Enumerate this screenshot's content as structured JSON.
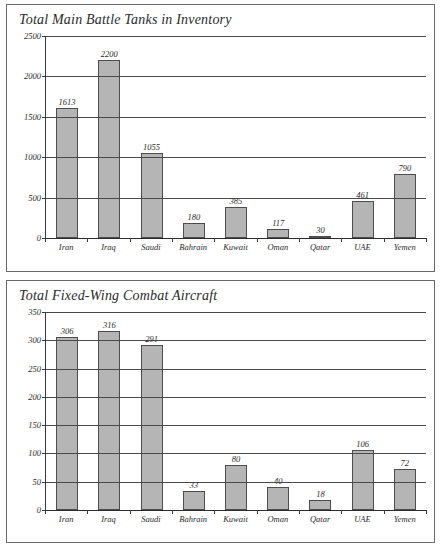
{
  "chart_data": [
    {
      "type": "bar",
      "title": "Total Main Battle Tanks in Inventory",
      "xlabel": "",
      "ylabel": "",
      "categories": [
        "Iran",
        "Iraq",
        "Saudi",
        "Bahrain",
        "Kuwait",
        "Oman",
        "Qatar",
        "UAE",
        "Yemen"
      ],
      "values": [
        1613,
        2200,
        1055,
        180,
        385,
        117,
        30,
        461,
        790
      ],
      "value_labels": [
        "1613",
        "2200",
        "1055",
        "180",
        "385",
        "117",
        "30",
        "461",
        "790"
      ],
      "ylim": [
        0,
        2500
      ],
      "yticks": [
        0,
        500,
        1000,
        1500,
        2000,
        2500
      ],
      "ytick_labels": [
        "0",
        "500",
        "1000",
        "1500",
        "2000",
        "2500"
      ],
      "grid": true,
      "legend": "none",
      "bar_color": "#b5b5b5",
      "bar_border_color": "#4d4d4d"
    },
    {
      "type": "bar",
      "title": "Total Fixed-Wing Combat Aircraft",
      "xlabel": "",
      "ylabel": "",
      "categories": [
        "Iran",
        "Iraq",
        "Saudi",
        "Bahrain",
        "Kuwait",
        "Oman",
        "Qatar",
        "UAE",
        "Yemen"
      ],
      "values": [
        306,
        316,
        291,
        33,
        80,
        40,
        18,
        106,
        72
      ],
      "value_labels": [
        "306",
        "316",
        "291",
        "33",
        "80",
        "40",
        "18",
        "106",
        "72"
      ],
      "ylim": [
        0,
        350
      ],
      "yticks": [
        0,
        50,
        100,
        150,
        200,
        250,
        300,
        350
      ],
      "ytick_labels": [
        "0",
        "50",
        "100",
        "150",
        "200",
        "250",
        "300",
        "350"
      ],
      "grid": true,
      "legend": "none",
      "bar_color": "#b5b5b5",
      "bar_border_color": "#4d4d4d"
    }
  ]
}
